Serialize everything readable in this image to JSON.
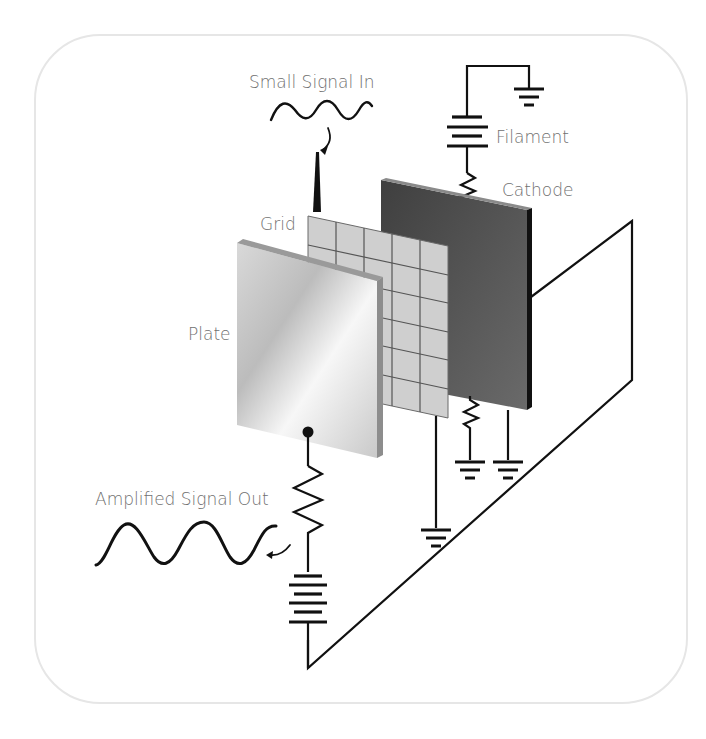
{
  "diagram": {
    "labels": {
      "small_signal_in": "Small Signal In",
      "filament": "Filament",
      "cathode": "Cathode",
      "grid": "Grid",
      "plate": "Plate",
      "amplified_signal_out": "Amplified Signal Out"
    },
    "components": [
      {
        "name": "plate",
        "type": "electrode",
        "appearance": "light gray gradient panel"
      },
      {
        "name": "grid",
        "type": "electrode",
        "appearance": "gray mesh panel 5x6"
      },
      {
        "name": "cathode",
        "type": "electrode",
        "appearance": "dark gray panel"
      },
      {
        "name": "filament-battery",
        "type": "battery"
      },
      {
        "name": "filament-resistor",
        "type": "resistor"
      },
      {
        "name": "cathode-resistor",
        "type": "resistor"
      },
      {
        "name": "plate-load-resistor",
        "type": "resistor"
      },
      {
        "name": "plate-battery",
        "type": "battery"
      },
      {
        "name": "grounds",
        "type": "ground",
        "count": 4
      }
    ],
    "colors": {
      "line": "#111111",
      "label": "#707070",
      "cathode": "#555555",
      "grid": "#c8c8c8",
      "plate_light": "#f4f4f4",
      "plate_dark": "#bdbdbd",
      "card_border": "#e6e6e6"
    }
  }
}
